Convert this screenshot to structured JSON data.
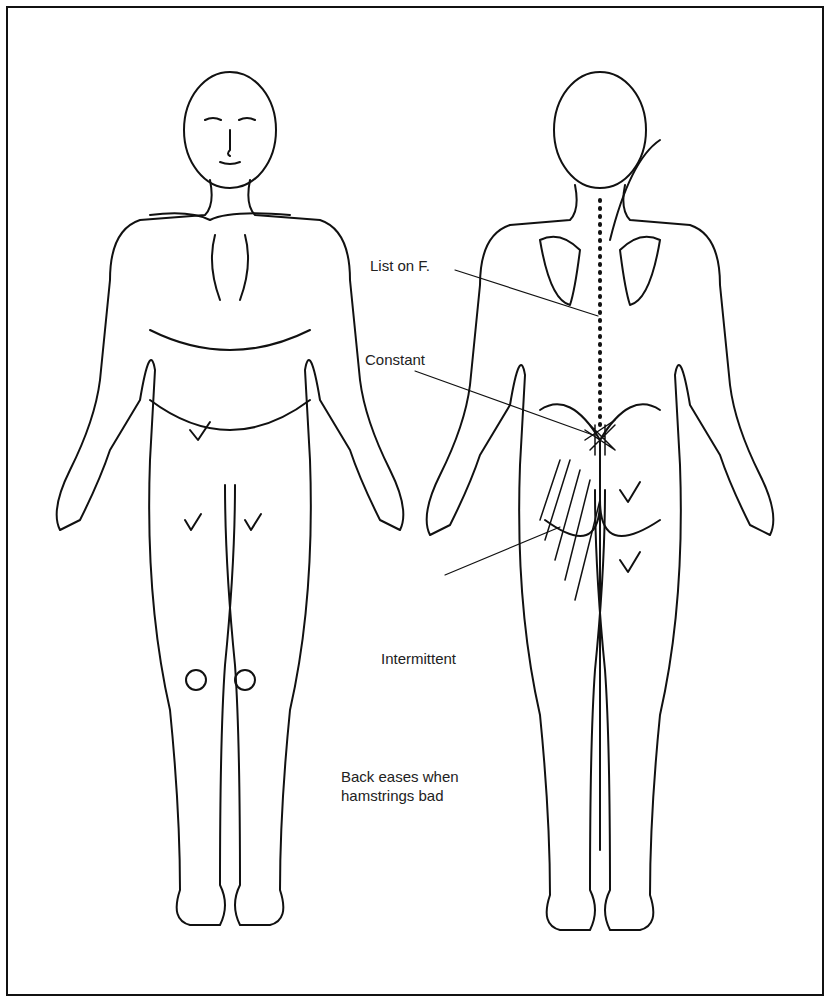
{
  "figure": {
    "views": [
      "front",
      "back"
    ],
    "annotations": {
      "list_on_f": "List on F.",
      "constant": "Constant",
      "intermittent": "Intermittent",
      "note_line1": "Back eases when",
      "note_line2": "hamstrings bad"
    },
    "marks": {
      "front": [
        "check-lower-abdomen",
        "check-left-thigh",
        "check-right-thigh",
        "circle-left-knee",
        "circle-right-knee"
      ],
      "back": [
        "check-right-buttock",
        "check-right-thigh",
        "crosshatch-lumbosacral",
        "hatch-left-buttock-thigh",
        "dotted-spine-line"
      ]
    },
    "colors": {
      "ink": "#111111",
      "background": "#ffffff"
    }
  }
}
